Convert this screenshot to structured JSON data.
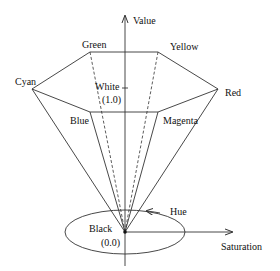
{
  "axes": {
    "value_label": "Value",
    "saturation_label": "Saturation",
    "hue_label": "Hue"
  },
  "vertices": {
    "green": "Green",
    "yellow": "Yellow",
    "cyan": "Cyan",
    "red": "Red",
    "blue": "Blue",
    "magenta": "Magenta"
  },
  "points": {
    "white_label": "White",
    "white_value": "(1.0)",
    "black_label": "Black",
    "black_value": "(0.0)"
  },
  "colors": {
    "line": "#333333",
    "text": "#111111"
  }
}
